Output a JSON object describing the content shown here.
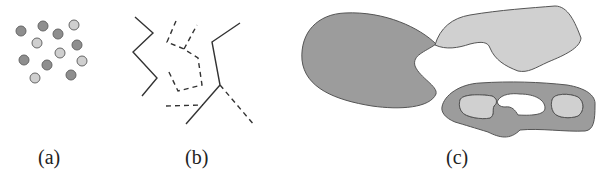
{
  "figure": {
    "panels": [
      {
        "id": "a",
        "label": "(a)",
        "content": "scattered points, two shades"
      },
      {
        "id": "b",
        "label": "(b)",
        "content": "solid and dashed polylines"
      },
      {
        "id": "c",
        "label": "(c)",
        "content": "filled regions, one with holes"
      }
    ],
    "colors": {
      "dark_fill": "#9c9c9c",
      "light_fill": "#d2d2d2",
      "outline": "#555555",
      "line": "#333333"
    },
    "points_dark": [
      [
        21,
        31
      ],
      [
        43,
        26
      ],
      [
        58,
        34
      ],
      [
        77,
        45
      ],
      [
        24,
        60
      ],
      [
        47,
        65
      ],
      [
        71,
        75
      ]
    ],
    "points_light": [
      [
        74,
        25
      ],
      [
        37,
        43
      ],
      [
        60,
        53
      ],
      [
        82,
        61
      ],
      [
        35,
        78
      ]
    ]
  }
}
